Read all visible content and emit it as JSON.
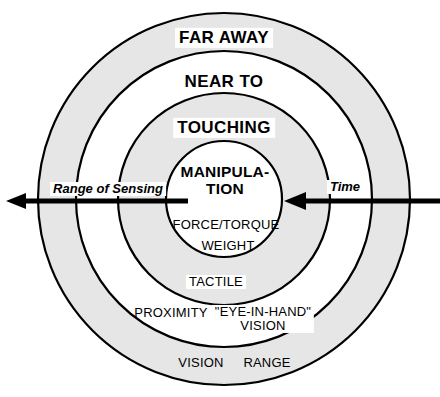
{
  "diagram": {
    "background_color": "#ffffff",
    "band_fill_color": "#e6e6e6",
    "stroke_color": "#000000",
    "zones": [
      {
        "id": "far-away",
        "major_label": "FAR AWAY",
        "radius": 186,
        "fill": "#e6e6e6"
      },
      {
        "id": "near-to",
        "major_label": "NEAR TO",
        "radius": 148,
        "fill": "#ffffff"
      },
      {
        "id": "touching",
        "major_label": "TOUCHING",
        "radius": 106,
        "fill": "#e6e6e6"
      },
      {
        "id": "manipulation",
        "major_label_line1": "MANIPULA-",
        "major_label_line2": "TION",
        "radius": 58,
        "fill": "#ffffff"
      }
    ],
    "sensor_labels": {
      "force_torque": "FORCE/TORQUE",
      "weight": "WEIGHT",
      "tactile": "TACTILE",
      "proximity": "PROXIMITY",
      "eye_in_hand_line1": "\"EYE-IN-HAND\"",
      "eye_in_hand_line2": "VISION",
      "vision": "VISION",
      "range": "RANGE"
    },
    "axes": {
      "left_arrow_label": "Range of Sensing",
      "right_arrow_label": "Time",
      "left_arrow_direction": "left",
      "right_arrow_direction": "left",
      "baseline_y": 201
    }
  }
}
